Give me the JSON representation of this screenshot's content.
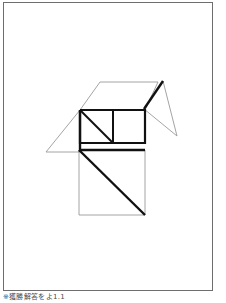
{
  "page": {
    "background_color": "#ffffff",
    "width": 226,
    "height": 303
  },
  "frame": {
    "border_color": "#6e6e6e",
    "x": 3,
    "y": 2,
    "width": 210,
    "height": 289
  },
  "caption": {
    "text": "※獲勝解答をよ1.1"
  },
  "figure": {
    "stroke_light": "#9a9a9a",
    "stroke_bold": "#111111",
    "fill": "none",
    "light_width": 0.9,
    "bold_width": 2.4,
    "shapes": [
      {
        "name": "large-parallelogram-roof",
        "style": "light",
        "points": "46,152 80,110 100,82 158,82"
      },
      {
        "name": "roof-right-edge",
        "style": "light",
        "points": "158,82 145,110"
      },
      {
        "name": "roof-bottom-edge",
        "style": "light",
        "points": "46,152 80,152"
      },
      {
        "name": "right-wing-triangle",
        "style": "light",
        "points": "163,81 177,136 144,109"
      },
      {
        "name": "right-wing-bold-edge",
        "style": "bold",
        "points": "163,81 144,109"
      },
      {
        "name": "upper-rectangle",
        "style": "bold",
        "points": "80,110 145,110 145,143 80,143 80,110"
      },
      {
        "name": "upper-rectangle-divider",
        "style": "bold",
        "points": "113,110 113,143"
      },
      {
        "name": "upper-rectangle-diagonal",
        "style": "bold",
        "points": "80,110 113,143"
      },
      {
        "name": "lower-square",
        "style": "light",
        "points": "79,150 145,150 145,215 79,215 79,150"
      },
      {
        "name": "lower-square-top-bold",
        "style": "bold",
        "points": "79,150 145,150"
      },
      {
        "name": "lower-square-diagonal",
        "style": "bold",
        "points": "79,150 145,215"
      },
      {
        "name": "left-vertical-bold",
        "style": "bold",
        "points": "80,110 80,152"
      }
    ]
  }
}
